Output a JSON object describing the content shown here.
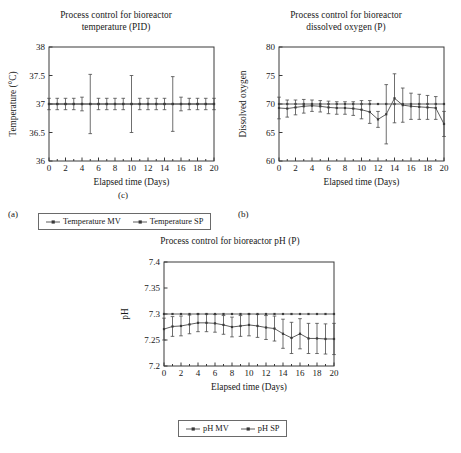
{
  "figure": {
    "panels": [
      {
        "letter": "(a)",
        "title_line1": "Process control for bioreactor",
        "title_line2": "temperature (PID)",
        "legend": [
          {
            "label": "Temperature MV",
            "icon": "line-marker-icon"
          },
          {
            "label": "Temperature SP",
            "icon": "line-marker-icon"
          }
        ]
      },
      {
        "letter": "(b)",
        "title_line1": "Process control for bioreactor",
        "title_line2": "dissolved oxygen (P)",
        "legend": [
          {
            "label": "Dissolved oxygen SP",
            "icon": "line-marker-icon"
          },
          {
            "label": "Dissolved oxygen MV",
            "icon": "line-marker-icon"
          }
        ]
      },
      {
        "letter": "(c)",
        "title_line1": "Process control for bioreactor pH (P)",
        "title_line2": "",
        "legend": [
          {
            "label": "pH MV",
            "icon": "line-marker-icon"
          },
          {
            "label": "pH SP",
            "icon": "line-marker-icon"
          }
        ]
      }
    ]
  },
  "chart_data": [
    {
      "id": "temperature",
      "type": "line",
      "title": "Process control for bioreactor temperature (PID)",
      "xlabel": "Elapsed time (Days)",
      "ylabel": "Temperature (°C)",
      "xlim": [
        0,
        20
      ],
      "ylim": [
        36,
        38
      ],
      "xticks": [
        0,
        2,
        4,
        6,
        8,
        10,
        12,
        14,
        16,
        18,
        20
      ],
      "xticklabels": [
        "0",
        "2",
        "4",
        "6",
        "8",
        "10",
        "12",
        "14",
        "16",
        "18",
        "20"
      ],
      "yticks": [
        36,
        36.5,
        37,
        37.5,
        38
      ],
      "yticklabels": [
        "36",
        "36.5",
        "37",
        "37.5",
        "38"
      ],
      "grid": false,
      "legend_position": "below",
      "x": [
        0,
        1,
        2,
        3,
        4,
        5,
        6,
        7,
        8,
        9,
        10,
        11,
        12,
        13,
        14,
        15,
        16,
        17,
        18,
        19,
        20
      ],
      "series": [
        {
          "name": "Temperature MV",
          "values": [
            37.0,
            37.0,
            37.0,
            37.0,
            37.0,
            37.0,
            37.0,
            37.0,
            37.0,
            37.0,
            37.0,
            37.0,
            37.0,
            37.0,
            37.0,
            37.0,
            37.0,
            37.0,
            37.0,
            37.0,
            37.0
          ],
          "errors": [
            0.1,
            0.1,
            0.1,
            0.1,
            0.12,
            0.52,
            0.1,
            0.1,
            0.1,
            0.1,
            0.5,
            0.1,
            0.1,
            0.1,
            0.1,
            0.48,
            0.12,
            0.1,
            0.1,
            0.1,
            0.1
          ]
        },
        {
          "name": "Temperature SP",
          "values": [
            37.0,
            37.0,
            37.0,
            37.0,
            37.0,
            37.0,
            37.0,
            37.0,
            37.0,
            37.0,
            37.0,
            37.0,
            37.0,
            37.0,
            37.0,
            37.0,
            37.0,
            37.0,
            37.0,
            37.0,
            37.0
          ],
          "errors": [
            0,
            0,
            0,
            0,
            0,
            0,
            0,
            0,
            0,
            0,
            0,
            0,
            0,
            0,
            0,
            0,
            0,
            0,
            0,
            0,
            0
          ]
        }
      ]
    },
    {
      "id": "dissolved-oxygen",
      "type": "line",
      "title": "Process control for bioreactor dissolved oxygen (P)",
      "xlabel": "Elapsed time (Days)",
      "ylabel": "Dissolved oxygen",
      "xlim": [
        0,
        20
      ],
      "ylim": [
        60,
        80
      ],
      "xticks": [
        0,
        2,
        4,
        6,
        8,
        10,
        12,
        14,
        16,
        18,
        20
      ],
      "xticklabels": [
        "0",
        "2",
        "4",
        "6",
        "8",
        "10",
        "12",
        "14",
        "16",
        "18",
        "20"
      ],
      "yticks": [
        60,
        65,
        70,
        75,
        80
      ],
      "yticklabels": [
        "60",
        "65",
        "70",
        "75",
        "80"
      ],
      "grid": false,
      "legend_position": "below",
      "x": [
        0,
        1,
        2,
        3,
        4,
        5,
        6,
        7,
        8,
        9,
        10,
        11,
        12,
        13,
        14,
        15,
        16,
        17,
        18,
        19,
        20
      ],
      "series": [
        {
          "name": "Dissolved oxygen SP",
          "values": [
            70,
            70,
            70,
            70,
            70,
            70,
            70,
            70,
            70,
            70,
            70,
            70,
            70,
            70,
            70,
            70,
            70,
            70,
            70,
            70,
            70
          ],
          "errors": [
            0,
            0,
            0,
            0,
            0,
            0,
            0,
            0,
            0,
            0,
            0,
            0,
            0,
            0,
            0,
            0,
            0,
            0,
            0,
            0,
            0
          ]
        },
        {
          "name": "Dissolved oxygen MV",
          "values": [
            69.3,
            69.2,
            69.4,
            69.6,
            69.7,
            69.6,
            69.4,
            69.3,
            69.3,
            69.2,
            69.0,
            68.6,
            67.3,
            68.2,
            71.0,
            69.8,
            69.6,
            69.5,
            69.4,
            69.3,
            66.5
          ],
          "errors": [
            1.9,
            1.5,
            1.3,
            1.2,
            1.0,
            1.0,
            1.1,
            1.1,
            1.1,
            1.2,
            1.6,
            2.0,
            1.4,
            5.2,
            4.3,
            3.0,
            2.3,
            2.2,
            2.1,
            2.0,
            2.2
          ]
        }
      ]
    },
    {
      "id": "ph",
      "type": "line",
      "title": "Process control for bioreactor pH (P)",
      "xlabel": "Elapsed time (Days)",
      "ylabel": "pH",
      "xlim": [
        0,
        20
      ],
      "ylim": [
        7.2,
        7.4
      ],
      "xticks": [
        0,
        2,
        4,
        6,
        8,
        10,
        12,
        14,
        16,
        18,
        20
      ],
      "xticklabels": [
        "0",
        "2",
        "4",
        "6",
        "8",
        "10",
        "12",
        "14",
        "16",
        "18",
        "20"
      ],
      "yticks": [
        7.2,
        7.25,
        7.3,
        7.35,
        7.4
      ],
      "yticklabels": [
        "7.2",
        "7.25",
        "7.3",
        "7.35",
        "7.4"
      ],
      "grid": false,
      "legend_position": "below",
      "x": [
        0,
        1,
        2,
        3,
        4,
        5,
        6,
        7,
        8,
        9,
        10,
        11,
        12,
        13,
        14,
        15,
        16,
        17,
        18,
        19,
        20
      ],
      "series": [
        {
          "name": "pH MV",
          "values": [
            7.271,
            7.276,
            7.277,
            7.28,
            7.283,
            7.283,
            7.282,
            7.279,
            7.275,
            7.277,
            7.279,
            7.277,
            7.274,
            7.272,
            7.262,
            7.254,
            7.262,
            7.253,
            7.253,
            7.252,
            7.252
          ],
          "errors": [
            0.021,
            0.019,
            0.019,
            0.018,
            0.017,
            0.017,
            0.017,
            0.018,
            0.019,
            0.02,
            0.021,
            0.022,
            0.023,
            0.024,
            0.028,
            0.03,
            0.029,
            0.029,
            0.029,
            0.029,
            0.03
          ]
        },
        {
          "name": "pH SP",
          "values": [
            7.3,
            7.3,
            7.3,
            7.3,
            7.3,
            7.3,
            7.3,
            7.3,
            7.3,
            7.3,
            7.3,
            7.3,
            7.3,
            7.3,
            7.3,
            7.3,
            7.3,
            7.3,
            7.3,
            7.3,
            7.3
          ],
          "errors": [
            0,
            0,
            0,
            0,
            0,
            0,
            0,
            0,
            0,
            0,
            0,
            0,
            0,
            0,
            0,
            0,
            0,
            0,
            0,
            0,
            0
          ]
        }
      ]
    }
  ]
}
